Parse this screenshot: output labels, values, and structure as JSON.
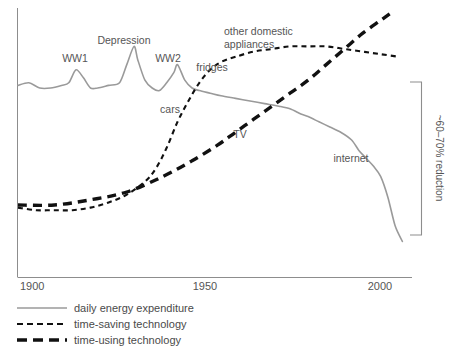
{
  "chart_data": {
    "type": "line",
    "title": "",
    "subtitle": "",
    "xlabel": "",
    "ylabel": "",
    "xlim": [
      1900,
      2007
    ],
    "ylim": [
      0,
      100
    ],
    "grid": false,
    "legend_position": "below-axes",
    "x_ticks": [
      "1900",
      "1950",
      "2000"
    ],
    "x_tick_values": [
      1900,
      1950,
      2000
    ],
    "y_ticks": [],
    "series": [
      {
        "name": "daily energy expenditure",
        "style": "solid",
        "color": "#9a9a9a",
        "x": [
          1900,
          1903,
          1906,
          1909,
          1912,
          1914,
          1916,
          1918,
          1920,
          1922,
          1925,
          1928,
          1930,
          1932,
          1933,
          1935,
          1937,
          1939,
          1941,
          1943,
          1944,
          1946,
          1948,
          1950,
          1953,
          1956,
          1960,
          1964,
          1968,
          1972,
          1975,
          1978,
          1980,
          1983,
          1986,
          1989,
          1992,
          1994,
          1996,
          1998,
          2000,
          2002,
          2004,
          2006
        ],
        "values": [
          71,
          72,
          70,
          70,
          71,
          72,
          77,
          74,
          70,
          70,
          71,
          72,
          79,
          86,
          81,
          73,
          70,
          69,
          72,
          76,
          79,
          73,
          70,
          69,
          68,
          67,
          66,
          65,
          64,
          63,
          62,
          60,
          59,
          57,
          55,
          53,
          50,
          46,
          43,
          40,
          36,
          28,
          17,
          11
        ]
      },
      {
        "name": "time-saving technology",
        "style": "dashed-fine",
        "color": "#111111",
        "x": [
          1900,
          1905,
          1910,
          1915,
          1920,
          1925,
          1930,
          1935,
          1938,
          1941,
          1944,
          1947,
          1950,
          1953,
          1956,
          1960,
          1965,
          1970,
          1975,
          1980,
          1985,
          1990,
          1995,
          2000,
          2005
        ],
        "values": [
          24,
          23,
          23,
          23,
          24,
          26,
          29,
          34,
          39,
          47,
          57,
          65,
          72,
          77,
          80,
          82,
          84,
          85,
          86,
          86,
          86,
          85,
          84,
          83,
          82
        ]
      },
      {
        "name": "time-using technology",
        "style": "dashed-bold",
        "color": "#111111",
        "x": [
          1900,
          1910,
          1920,
          1930,
          1940,
          1948,
          1955,
          1960,
          1965,
          1970,
          1975,
          1980,
          1985,
          1990,
          1995,
          2000,
          2003
        ],
        "values": [
          25,
          25,
          27,
          30,
          36,
          42,
          48,
          53,
          58,
          63,
          68,
          73,
          79,
          85,
          91,
          96,
          99
        ]
      }
    ],
    "annotations": [
      {
        "name": "ww1",
        "text": "WW1",
        "x": 1915,
        "anchor": "middle"
      },
      {
        "name": "depression",
        "text": "Depression",
        "x": 1931,
        "anchor": "middle"
      },
      {
        "name": "ww2",
        "text": "WW2",
        "x": 1944,
        "anchor": "middle"
      },
      {
        "name": "fridges",
        "text": "fridges",
        "x": 1952,
        "anchor": "middle"
      },
      {
        "name": "other-domestic-appliances-line1",
        "text": "other domestic",
        "x": 1975,
        "anchor": "start"
      },
      {
        "name": "other-domestic-appliances-line2",
        "text": "appliances",
        "x": 1975,
        "anchor": "start"
      },
      {
        "name": "cars",
        "text": "cars",
        "x": 1947,
        "anchor": "middle"
      },
      {
        "name": "tv",
        "text": "TV",
        "x": 1968,
        "anchor": "middle"
      },
      {
        "name": "internet",
        "text": "internet",
        "x": 1995,
        "anchor": "middle"
      }
    ],
    "bracket": {
      "label": "~60–70% reduction",
      "span_top": 82,
      "span_bottom": 235
    }
  },
  "legend": {
    "items": [
      {
        "label": "daily energy expenditure",
        "style": "solid",
        "color": "#9a9a9a"
      },
      {
        "label": "time-saving technology",
        "style": "dashed-fine",
        "color": "#111111"
      },
      {
        "label": "time-using technology",
        "style": "dashed-bold",
        "color": "#111111"
      }
    ]
  },
  "axis": {
    "tick_1900": "1900",
    "tick_1950": "1950",
    "tick_2000": "2000"
  },
  "bracket_label": "~60–70% reduction",
  "annotation_text": {
    "ww1": "WW1",
    "depression": "Depression",
    "ww2": "WW2",
    "fridges": "fridges",
    "other_domestic_1": "other domestic",
    "other_domestic_2": "appliances",
    "cars": "cars",
    "tv": "TV",
    "internet": "internet"
  }
}
